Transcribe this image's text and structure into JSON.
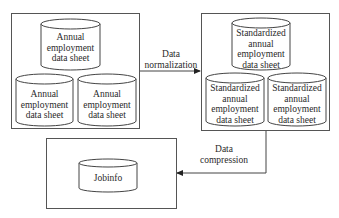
{
  "diagram": {
    "source_group": {
      "tables": [
        {
          "label_lines": [
            "Annual",
            "employment",
            "data sheet"
          ]
        },
        {
          "label_lines": [
            "Annual",
            "employment",
            "data sheet"
          ]
        },
        {
          "label_lines": [
            "Annual",
            "employment",
            "data sheet"
          ]
        }
      ]
    },
    "normalized_group": {
      "tables": [
        {
          "label_lines": [
            "Standardized",
            "annual",
            "employment",
            "data sheet"
          ]
        },
        {
          "label_lines": [
            "Standardized",
            "annual",
            "employment",
            "data sheet"
          ]
        },
        {
          "label_lines": [
            "Standardized",
            "annual",
            "employment",
            "data sheet"
          ]
        }
      ]
    },
    "output_group": {
      "tables": [
        {
          "label_lines": [
            "Jobinfo"
          ]
        }
      ]
    },
    "edges": [
      {
        "from": "source_group",
        "to": "normalized_group",
        "label_lines": [
          "Data",
          "normalization"
        ]
      },
      {
        "from": "normalized_group",
        "to": "output_group",
        "label_lines": [
          "Data",
          "compression"
        ]
      }
    ]
  }
}
